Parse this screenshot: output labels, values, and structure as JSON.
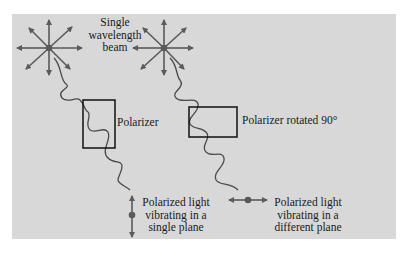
{
  "diagram": {
    "background_color": "#d8d8d8",
    "stroke_color": "#5a5a5a",
    "box_color": "#111111",
    "source_label_line1": "Single",
    "source_label_line2": "wavelength",
    "source_label_line3": "beam",
    "polarizer1_label": "Polarizer",
    "polarizer2_label": "Polarizer rotated 90°",
    "result1_line1": "Polarized light",
    "result1_line2": "vibrating in a",
    "result1_line3": "single plane",
    "result2_line1": "Polarized light",
    "result2_line2": "vibrating in a",
    "result2_line3": "different plane"
  }
}
